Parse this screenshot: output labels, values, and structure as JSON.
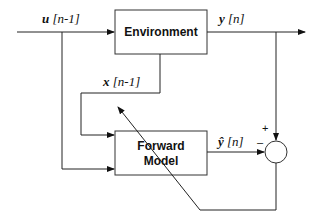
{
  "diagram": {
    "blocks": {
      "environment": {
        "label": "Environment"
      },
      "forward_model": {
        "label_line1": "Forward",
        "label_line2": "Model"
      }
    },
    "signals": {
      "input": {
        "var": "u",
        "index": "[n-1]"
      },
      "output": {
        "var": "y",
        "index": "[n]"
      },
      "state": {
        "var": "x",
        "index": "[n-1]"
      },
      "prediction": {
        "var": "ŷ",
        "index": "[n]"
      }
    },
    "summing_junction": {
      "plus": "+",
      "minus": "–"
    }
  }
}
